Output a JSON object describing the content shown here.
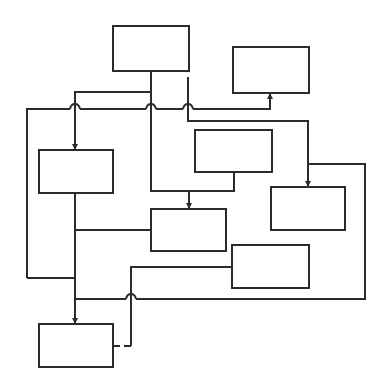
{
  "diagram": {
    "type": "flow-block-diagram",
    "background": "#ffffff",
    "stroke_color": "#2b2b2b",
    "stroke_width": 2,
    "boxes": [
      {
        "id": "box-top",
        "x": 113,
        "y": 26,
        "w": 76,
        "h": 45,
        "label": ""
      },
      {
        "id": "box-top-right",
        "x": 233,
        "y": 47,
        "w": 76,
        "h": 46,
        "label": ""
      },
      {
        "id": "box-left",
        "x": 39,
        "y": 150,
        "w": 74,
        "h": 43,
        "label": ""
      },
      {
        "id": "box-mid-right",
        "x": 195,
        "y": 130,
        "w": 77,
        "h": 42,
        "label": ""
      },
      {
        "id": "box-right",
        "x": 271,
        "y": 187,
        "w": 74,
        "h": 43,
        "label": ""
      },
      {
        "id": "box-center",
        "x": 151,
        "y": 209,
        "w": 75,
        "h": 42,
        "label": ""
      },
      {
        "id": "box-lower-right",
        "x": 232,
        "y": 245,
        "w": 77,
        "h": 43,
        "label": ""
      },
      {
        "id": "box-bottom",
        "x": 39,
        "y": 324,
        "w": 74,
        "h": 43,
        "label": ""
      }
    ],
    "connectors": [
      {
        "id": "top-to-left",
        "points": "151,71 151,92 75,92 75,150",
        "arrow": "down"
      },
      {
        "id": "top-trunk-to-center",
        "points": "151,92 151,191 234,191",
        "arrow": "none"
      },
      {
        "id": "midright-to-center",
        "points": "234,172 234,191 189,191 189,209",
        "arrow": "down"
      },
      {
        "id": "top-right-side-to-right-box",
        "points": "188,77 188,121 308,121 308,187",
        "arrow": "down"
      },
      {
        "id": "left-bus-to-topright",
        "points": "27,278 27,109 270,109 270,93",
        "arrow": "up"
      },
      {
        "id": "left-spine",
        "points": "75,193 75,324",
        "arrow": "down"
      },
      {
        "id": "left-bus-return",
        "points": "27,278 75,278",
        "arrow": "none"
      },
      {
        "id": "spine-to-center",
        "points": "75,230 151,230",
        "arrow": "none"
      },
      {
        "id": "outer-right-loop",
        "points": "308,164 365,164 365,299 75,299",
        "arrow": "none"
      },
      {
        "id": "lowerright-to-bottom",
        "points": "232,267 131,267 131,346 113,346",
        "arrow": "none",
        "dashed_tail": true
      }
    ],
    "line_hops": [
      {
        "x": 75,
        "y": 109
      },
      {
        "x": 151,
        "y": 109
      },
      {
        "x": 188,
        "y": 109
      },
      {
        "x": 131,
        "y": 299
      }
    ]
  }
}
